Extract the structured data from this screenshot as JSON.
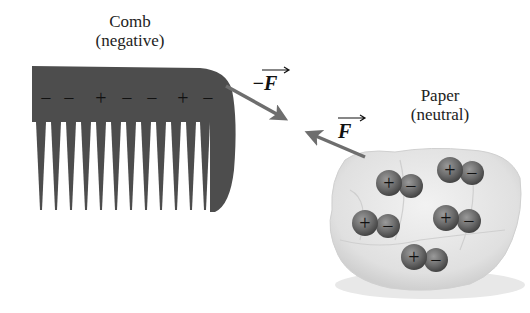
{
  "comb": {
    "title": "Comb",
    "subtitle": "(negative)",
    "charges": [
      "−",
      "−",
      "+",
      "−",
      "−",
      "+",
      "−"
    ],
    "tooth_count": 12,
    "color": "#4a4a4a"
  },
  "paper": {
    "title": "Paper",
    "subtitle": "(neutral)",
    "dipoles": [
      {
        "plus": "+",
        "minus": "−"
      },
      {
        "plus": "+",
        "minus": "−"
      },
      {
        "plus": "+",
        "minus": "−"
      },
      {
        "plus": "+",
        "minus": "−"
      },
      {
        "plus": "+",
        "minus": "−"
      }
    ],
    "color": "#e4e4e4"
  },
  "forces": {
    "on_comb": "−F",
    "on_paper": "F",
    "arrow_color": "#6e6e6e"
  }
}
